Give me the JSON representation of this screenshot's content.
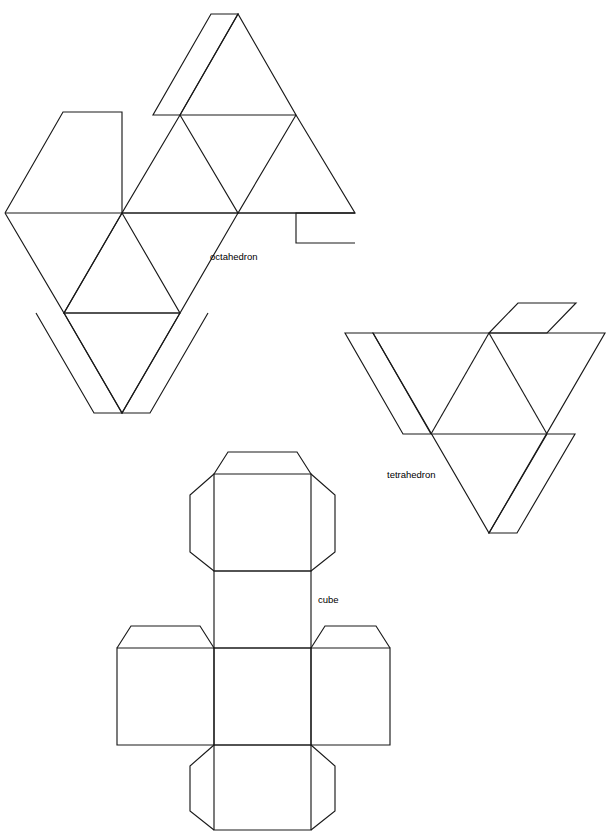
{
  "page": {
    "width": 610,
    "height": 839,
    "background_color": "#ffffff",
    "stroke_color": "#1a1a1a",
    "text_color": "#000000"
  },
  "labels": {
    "octahedron": "octahedron",
    "tetrahedron": "tetrahedron",
    "cube": "cube"
  },
  "figures": [
    {
      "name": "octahedron",
      "label": "octahedron",
      "label_x": 210,
      "label_y": 257,
      "face_count": 8,
      "face_shape": "equilateral-triangle",
      "tab_count": 5,
      "description": "Net of a regular octahedron: a strip of eight equilateral triangles arranged in two rows of four, with glue tabs along the outer edges."
    },
    {
      "name": "tetrahedron",
      "label": "tetrahedron",
      "label_x": 387,
      "label_y": 475,
      "face_count": 4,
      "face_shape": "equilateral-triangle",
      "tab_count": 3,
      "description": "Net of a regular tetrahedron: one large equilateral triangle subdivided into four smaller equilateral triangles, with three glue tabs."
    },
    {
      "name": "cube",
      "label": "cube",
      "label_x": 318,
      "label_y": 600,
      "face_count": 6,
      "face_shape": "square",
      "tab_count": 7,
      "description": "Net of a cube: a cross (Latin-cross) arrangement of six squares with trapezoidal glue tabs on the free edges."
    }
  ],
  "geometry": {
    "octahedron": {
      "faces": [
        "M 180,115 L 238,14 L 296,115 Z",
        "M 180,115 L 296,115 L 238,213 Z",
        "M 180,115 L 238,213 L 122,213 Z",
        "M 296,115 L 355,213 L 238,213 Z",
        "M 5,213 L 122,213 L 64,313 Z",
        "M 122,213 L 238,213 L 180,313 Z",
        "M 122,213 L 180,313 L 64,313 Z",
        "M 64,313 L 180,313 L 122,413 Z"
      ],
      "tabs": [
        "M 180,115 L 238,14 L 210,14 L 152,115 Z",
        "M 5,213 L 64,112 L 122,112 L 122,213 Z",
        "M 355,213 L 296,213 L 296,243 L 355,243 Z",
        "M 64,313 L 122,413 L 92,413 L 34,313 Z",
        "M 180,313 L 122,413 L 152,413 L 210,313 Z"
      ]
    },
    "tetrahedron": {
      "faces": [
        "M 431,434 L 489,333 L 547,434 Z",
        "M 431,434 L 547,434 L 489,533 Z",
        "M 489,333 L 431,434 L 373,333 Z",
        "M 547,434 L 489,333 L 605,333 Z"
      ],
      "tabs": [
        "M 373,333 L 431,434 L 401,434 L 343,333 Z",
        "M 489,333 L 547,333 L 576,303 L 518,303 Z",
        "M 547,434 L 489,533 L 519,533 L 577,434 Z"
      ]
    },
    "cube": {
      "faces": [
        "M 214,474 L 311,474 L 311,571 L 214,571 Z",
        "M 214,571 L 311,571 L 311,648 L 214,648 Z",
        "M 117,648 L 214,648 L 214,745 L 117,745 Z",
        "M 214,648 L 311,648 L 311,745 L 214,745 Z",
        "M 311,648 L 390,648 L 390,745 L 311,745 Z",
        "M 214,745 L 311,745 L 311,829 L 214,829 Z"
      ],
      "tabs": [
        "M 214,474 L 311,474 L 297,452 L 228,452 Z",
        "M 214,474 L 214,571 L 189,553 L 189,495 Z",
        "M 311,474 L 311,571 L 336,553 L 336,495 Z",
        "M 117,648 L 214,648 L 200,626 L 131,626 Z",
        "M 311,648 L 390,648 L 376,626 L 325,626 Z",
        "M 214,745 L 214,829 L 189,811 L 189,765 Z",
        "M 311,745 L 311,829 L 336,811 L 336,765 Z"
      ]
    }
  }
}
